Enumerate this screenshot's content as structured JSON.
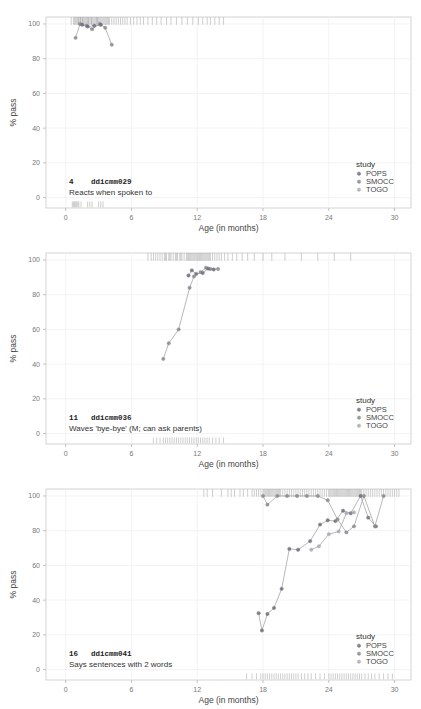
{
  "figure": {
    "panel_count": 3,
    "axis": {
      "xlabel": "Age (in months)",
      "ylabel": "% pass",
      "xticks": [
        "0",
        "6",
        "12",
        "18",
        "24",
        "30"
      ],
      "yticks": [
        "0",
        "20",
        "40",
        "60",
        "80",
        "100"
      ],
      "xlim": [
        -1.8,
        31.5
      ],
      "ylim": [
        -6,
        104
      ]
    },
    "legend": {
      "title": "study",
      "items": [
        {
          "label": "POPS",
          "color": "#6f6f7d"
        },
        {
          "label": "SMOCC",
          "color": "#8a8a8a"
        },
        {
          "label": "TOGO",
          "color": "#a9a9b4"
        }
      ]
    },
    "colors": {
      "panel_border": "#c8c8c8",
      "grid": "#eeeef2",
      "rug": "#9b9b9b",
      "point": "#7a7a86",
      "line": "#9a9aa4",
      "background": "#ffffff"
    }
  },
  "chart_data": [
    {
      "type": "line",
      "index": "4",
      "code": "ddicmm029",
      "description": "Reacts when spoken to",
      "xlabel": "Age (in months)",
      "ylabel": "% pass",
      "xlim": [
        -1.8,
        31.5
      ],
      "ylim": [
        -6,
        104
      ],
      "grid": true,
      "legend_position": "bottom-right",
      "series": [
        {
          "name": "SMOCC",
          "color": "#8a8a8a",
          "x": [
            0.9,
            1.3,
            1.9,
            2.4,
            3.1,
            3.6,
            4.2
          ],
          "y": [
            92.0,
            100.0,
            99.0,
            97.0,
            100.0,
            97.8,
            88.0
          ]
        },
        {
          "name": "POPS",
          "color": "#6f6f7d",
          "x": [
            1.5,
            2.0,
            2.6,
            3.2
          ],
          "y": [
            99.5,
            98.5,
            99.0,
            99.5
          ]
        }
      ],
      "rug_top": [
        0.5,
        0.7,
        0.8,
        0.9,
        1.0,
        1.1,
        1.15,
        1.2,
        1.3,
        1.35,
        1.4,
        1.5,
        1.55,
        1.6,
        1.7,
        1.8,
        1.9,
        2.0,
        2.05,
        2.1,
        2.2,
        2.3,
        2.35,
        2.4,
        2.5,
        2.6,
        2.7,
        2.8,
        2.85,
        2.9,
        3.0,
        3.1,
        3.2,
        3.3,
        3.4,
        3.5,
        3.6,
        3.7,
        3.8,
        3.9,
        4.0,
        4.2,
        4.4,
        4.6,
        4.8,
        5.0,
        5.2,
        5.4,
        5.6,
        5.9,
        6.2,
        6.5,
        6.8,
        7.1,
        7.5,
        7.9,
        8.3,
        8.7,
        9.2,
        9.6,
        10.1,
        10.6,
        11.1,
        11.6,
        12.1,
        12.5,
        12.9,
        13.2,
        13.6,
        14.0,
        14.4
      ],
      "rug_bottom": [
        0.6,
        0.7,
        0.8,
        0.9,
        1.0,
        1.1,
        1.2,
        1.4,
        2.0,
        2.2,
        2.4,
        3.0,
        3.2,
        3.4
      ]
    },
    {
      "type": "line",
      "index": "11",
      "code": "ddicmm036",
      "description": "Waves 'bye-bye' (M; can ask parents)",
      "xlabel": "Age (in months)",
      "ylabel": "% pass",
      "xlim": [
        -1.8,
        31.5
      ],
      "ylim": [
        -6,
        104
      ],
      "grid": true,
      "legend_position": "bottom-right",
      "series": [
        {
          "name": "SMOCC",
          "color": "#8a8a8a",
          "x": [
            8.9,
            9.4,
            10.3,
            11.3,
            11.7,
            12.3,
            12.8,
            13.2,
            13.9
          ],
          "y": [
            43.0,
            52.0,
            60.0,
            84.0,
            90.5,
            93.0,
            95.5,
            94.8,
            94.8
          ]
        },
        {
          "name": "POPS",
          "color": "#6f6f7d",
          "x": [
            11.2,
            11.5,
            11.9,
            12.5,
            13.0,
            13.5
          ],
          "y": [
            91.0,
            94.0,
            92.0,
            92.5,
            95.0,
            94.5
          ]
        }
      ],
      "rug_top": [
        7.5,
        7.8,
        8.0,
        8.2,
        8.4,
        8.6,
        8.8,
        9.0,
        9.1,
        9.2,
        9.4,
        9.5,
        9.6,
        9.8,
        10.0,
        10.1,
        10.2,
        10.4,
        10.5,
        10.6,
        10.8,
        11.0,
        11.1,
        11.2,
        11.3,
        11.4,
        11.5,
        11.6,
        11.7,
        11.8,
        11.9,
        12.0,
        12.1,
        12.2,
        12.3,
        12.4,
        12.5,
        12.6,
        12.7,
        12.8,
        12.9,
        13.0,
        13.1,
        13.2,
        13.4,
        13.6,
        13.8,
        14.0,
        14.2,
        14.5,
        14.8,
        15.2,
        15.6,
        16.1,
        16.6,
        17.2,
        18.0,
        18.8,
        20.0,
        21.5,
        23.0,
        24.5,
        26.0
      ],
      "rug_bottom": [
        8.0,
        8.3,
        8.6,
        8.9,
        9.1,
        9.3,
        9.5,
        9.7,
        9.9,
        10.1,
        10.3,
        10.5,
        10.7,
        10.9,
        11.1,
        11.3,
        11.5,
        11.7,
        11.9,
        12.1,
        12.3,
        12.5,
        12.7,
        12.9,
        13.1,
        13.4,
        13.7,
        14.0,
        14.4
      ]
    },
    {
      "type": "line",
      "index": "16",
      "code": "ddicmm041",
      "description": "Says sentences with 2 words",
      "xlabel": "Age (in months)",
      "ylabel": "% pass",
      "xlim": [
        -1.8,
        31.5
      ],
      "ylim": [
        -6,
        104
      ],
      "grid": true,
      "legend_position": "bottom-right",
      "series": [
        {
          "name": "POPS",
          "color": "#6f6f7d",
          "x": [
            17.6,
            17.9,
            18.4,
            19.0,
            19.7,
            20.4,
            21.2,
            22.3,
            23.2,
            23.9,
            24.6,
            25.3,
            26.0,
            26.9,
            27.6,
            28.3
          ],
          "y": [
            32.5,
            22.5,
            32.0,
            35.5,
            46.5,
            69.5,
            69.0,
            74.0,
            83.5,
            86.0,
            85.5,
            91.5,
            90.0,
            100.0,
            87.5,
            82.5
          ]
        },
        {
          "name": "SMOCC",
          "color": "#8a8a8a",
          "x": [
            18.0,
            18.4,
            19.3,
            20.2,
            21.1,
            22.0,
            23.0,
            23.9,
            24.8,
            25.6,
            26.3,
            27.2,
            28.2,
            29.0
          ],
          "y": [
            100.0,
            95.0,
            100.0,
            100.0,
            100.0,
            100.0,
            100.0,
            97.5,
            86.5,
            79.0,
            82.5,
            100.0,
            82.5,
            100.0
          ]
        },
        {
          "name": "TOGO",
          "color": "#a9a9b4",
          "x": [
            22.4,
            23.1,
            24.0,
            24.9,
            25.6,
            26.3
          ],
          "y": [
            69.0,
            71.0,
            78.0,
            79.5,
            90.0,
            90.5
          ]
        }
      ],
      "rug_top": [
        12.6,
        12.9,
        13.4,
        14.2,
        14.8,
        15.1,
        15.4,
        15.9,
        16.2,
        16.6,
        17.0,
        17.2,
        17.4,
        17.6,
        17.8,
        18.0,
        18.1,
        18.2,
        18.3,
        18.4,
        18.5,
        18.6,
        18.7,
        18.8,
        18.9,
        19.0,
        19.1,
        19.2,
        19.3,
        19.4,
        19.5,
        19.6,
        19.8,
        20.0,
        20.2,
        20.4,
        20.6,
        20.8,
        21.0,
        21.2,
        21.4,
        21.6,
        21.8,
        22.0,
        22.2,
        22.4,
        22.6,
        22.8,
        23.0,
        23.2,
        23.4,
        23.6,
        23.8,
        24.0,
        24.1,
        24.2,
        24.3,
        24.4,
        24.5,
        24.6,
        24.7,
        24.8,
        24.9,
        25.0,
        25.1,
        25.2,
        25.3,
        25.4,
        25.5,
        25.6,
        25.7,
        25.8,
        25.9,
        26.0,
        26.1,
        26.2,
        26.3,
        26.4,
        26.5,
        26.6,
        26.7,
        26.8,
        26.9,
        27.0,
        27.2,
        27.4,
        27.6,
        27.8,
        28.0,
        28.2,
        28.4,
        28.6,
        28.8,
        29.0,
        29.2,
        29.4,
        29.6,
        29.8,
        30.0,
        30.2,
        30.4
      ],
      "rug_bottom": [
        16.5,
        17.0,
        17.4,
        17.8,
        18.0,
        18.2,
        18.4,
        18.6,
        18.8,
        19.0,
        19.2,
        19.4,
        19.6,
        19.8,
        20.0,
        20.2,
        20.4,
        20.6,
        20.8,
        21.0,
        21.2,
        21.5,
        21.8,
        22.1,
        22.4,
        22.8,
        23.2,
        23.6,
        24.0,
        24.2,
        24.4,
        24.6,
        24.8,
        25.0,
        25.2,
        25.4,
        25.6,
        25.8,
        26.0,
        26.2,
        26.4,
        26.6,
        26.8,
        27.0,
        27.3,
        27.6,
        27.9,
        28.2,
        28.6,
        29.0,
        29.4,
        29.8
      ]
    }
  ]
}
